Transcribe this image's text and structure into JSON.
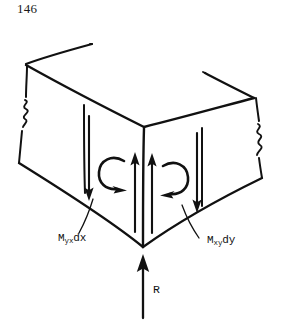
{
  "page": {
    "number": "146",
    "width": 283,
    "height": 328,
    "background_color": "#ffffff",
    "ink_color": "#111111"
  },
  "figure": {
    "labels": {
      "moment_left": {
        "symbol": "M",
        "subscript": "yx",
        "differential": "dx",
        "full_text": "Myxdx"
      },
      "moment_right": {
        "symbol": "M",
        "subscript": "xy",
        "differential": "dy",
        "full_text": "Mxydy"
      },
      "reaction": {
        "full_text": "R"
      }
    },
    "arrows": {
      "reaction_up": "upward-arrow-at-corner",
      "center_up_pair": "two-upward-arrows",
      "left_face_down": "downward-arrow",
      "right_face_down": "downward-arrow",
      "left_moment_curve": "counterclockwise-curved-arrow",
      "right_moment_curve": "clockwise-curved-arrow"
    },
    "break_marks": [
      "left-edge-zigzag-break",
      "right-edge-zigzag-break"
    ]
  }
}
